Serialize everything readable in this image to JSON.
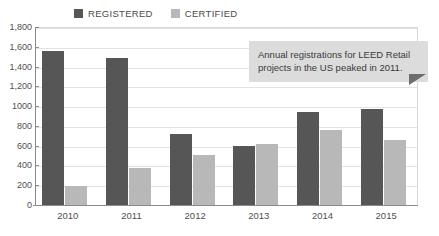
{
  "chart_data": {
    "type": "bar",
    "title": "",
    "subtitle": "",
    "xlabel": "",
    "ylabel": "",
    "categories": [
      "2010",
      "2011",
      "2012",
      "2013",
      "2014",
      "2015"
    ],
    "series": [
      {
        "name": "REGISTERED",
        "color": "#565656",
        "values": [
          1560,
          1490,
          720,
          595,
          940,
          975
        ]
      },
      {
        "name": "CERTIFIED",
        "color": "#b8b8b8",
        "values": [
          190,
          370,
          510,
          615,
          755,
          660
        ]
      }
    ],
    "ylim": [
      0,
      1800
    ],
    "ytick_values": [
      0,
      200,
      400,
      600,
      800,
      1000,
      1200,
      1400,
      1600,
      1800
    ],
    "ytick_labels": [
      "0",
      "200",
      "400",
      "600",
      "800",
      "1000",
      "1,200",
      "1,400",
      "1,600",
      "1,800"
    ],
    "grid": true,
    "legend_position": "top-center",
    "annotations": [
      {
        "text": "Annual registrations for LEED Retail projects in the US peaked in 2011.",
        "position": "top-right",
        "background": "#dcdcdc",
        "tail": "down-right"
      }
    ]
  },
  "legend": {
    "items": [
      {
        "label": "REGISTERED",
        "color": "#565656"
      },
      {
        "label": "CERTIFIED",
        "color": "#b8b8b8"
      }
    ]
  },
  "annotation": {
    "text": "Annual registrations for LEED Retail projects in the US peaked in 2011."
  }
}
